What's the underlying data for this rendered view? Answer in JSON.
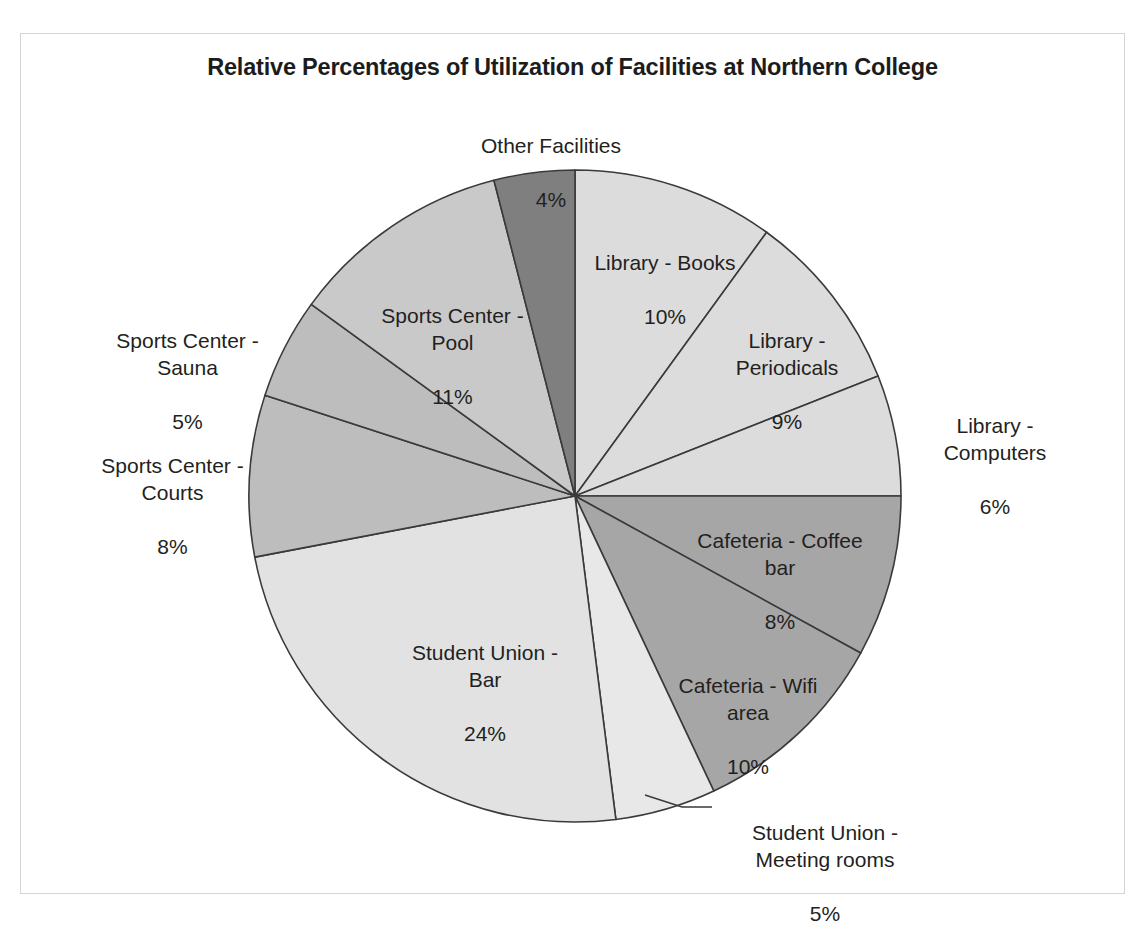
{
  "chart_data": {
    "type": "pie",
    "title": "Relative Percentages of Utilization of Facilities at Northern College",
    "xlabel": "",
    "ylabel": "",
    "legend": "none",
    "grid": false,
    "value_unit": "%",
    "start_angle_deg": 0,
    "direction": "clockwise",
    "categories": [
      "Library - Books",
      "Library - Periodicals",
      "Library - Computers",
      "Cafeteria - Coffee bar",
      "Cafeteria - Wifi area",
      "Student Union - Meeting rooms",
      "Student Union - Bar",
      "Sports Center - Courts",
      "Sports Center - Sauna",
      "Sports Center - Pool",
      "Other Facilities"
    ],
    "values": [
      10,
      9,
      6,
      8,
      10,
      5,
      24,
      8,
      5,
      11,
      4
    ],
    "colors": [
      "#dcdcdc",
      "#dcdcdc",
      "#dcdcdc",
      "#a6a6a6",
      "#a6a6a6",
      "#e8e8e8",
      "#e2e2e2",
      "#bdbdbd",
      "#bdbdbd",
      "#c9c9c9",
      "#7f7f7f"
    ],
    "slices": [
      {
        "label": "Library - Books",
        "value": 10,
        "value_text": "10%",
        "color": "#dcdcdc"
      },
      {
        "label": "Library - Periodicals",
        "value": 9,
        "value_text": "9%",
        "color": "#dcdcdc"
      },
      {
        "label": "Library - Computers",
        "value": 6,
        "value_text": "6%",
        "color": "#dcdcdc"
      },
      {
        "label": "Cafeteria - Coffee bar",
        "value": 8,
        "value_text": "8%",
        "color": "#a6a6a6"
      },
      {
        "label": "Cafeteria - Wifi area",
        "value": 10,
        "value_text": "10%",
        "color": "#a6a6a6"
      },
      {
        "label": "Student Union - Meeting rooms",
        "value": 5,
        "value_text": "5%",
        "color": "#e8e8e8"
      },
      {
        "label": "Student Union - Bar",
        "value": 24,
        "value_text": "24%",
        "color": "#e2e2e2"
      },
      {
        "label": "Sports Center - Courts",
        "value": 8,
        "value_text": "8%",
        "color": "#bdbdbd"
      },
      {
        "label": "Sports Center - Sauna",
        "value": 5,
        "value_text": "5%",
        "color": "#bdbdbd"
      },
      {
        "label": "Sports Center - Pool",
        "value": 11,
        "value_text": "11%",
        "color": "#c9c9c9"
      },
      {
        "label": "Other Facilities",
        "value": 4,
        "value_text": "4%",
        "color": "#7f7f7f"
      }
    ]
  },
  "labels": {
    "other_facilities_name": "Other Facilities",
    "other_facilities_value": "4%",
    "library_books_name": "Library - Books",
    "library_books_value": "10%",
    "library_periodicals_name": "Library -\nPeriodicals",
    "library_periodicals_value": "9%",
    "library_computers_name": "Library -\nComputers",
    "library_computers_value": "6%",
    "cafeteria_coffee_name": "Cafeteria - Coffee\nbar",
    "cafeteria_coffee_value": "8%",
    "cafeteria_wifi_name": "Cafeteria - Wifi\narea",
    "cafeteria_wifi_value": "10%",
    "union_meeting_name": "Student Union -\nMeeting rooms",
    "union_meeting_value": "5%",
    "union_bar_name": "Student Union -\nBar",
    "union_bar_value": "24%",
    "sports_courts_name": "Sports Center -\nCourts",
    "sports_courts_value": "8%",
    "sports_sauna_name": "Sports Center -\nSauna",
    "sports_sauna_value": "5%",
    "sports_pool_name": "Sports Center -\nPool",
    "sports_pool_value": "11%"
  },
  "style": {
    "frame_border_color": "#d5d5d5",
    "slice_outline_color": "#3a3a3a",
    "text_color": "#231f20",
    "background": "#ffffff"
  }
}
